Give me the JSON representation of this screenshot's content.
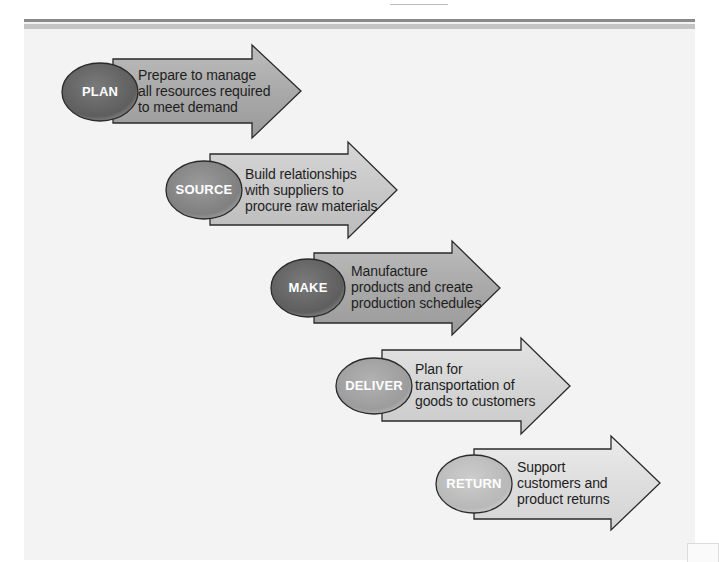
{
  "diagram": {
    "type": "process-flow",
    "steps": [
      {
        "id": "plan",
        "label": "PLAN",
        "description_lines": [
          "Prepare to manage",
          "all resources required",
          "to meet demand"
        ],
        "ellipse_color": "#6e6e6e",
        "arrow_color": "#a8a8a8"
      },
      {
        "id": "source",
        "label": "SOURCE",
        "description_lines": [
          "Build relationships",
          "with suppliers to",
          "procure raw materials"
        ],
        "ellipse_color": "#8a8a8a",
        "arrow_color": "#c4c4c4"
      },
      {
        "id": "make",
        "label": "MAKE",
        "description_lines": [
          "Manufacture",
          "products and create",
          "production schedules"
        ],
        "ellipse_color": "#6e6e6e",
        "arrow_color": "#a8a8a8"
      },
      {
        "id": "deliver",
        "label": "DELIVER",
        "description_lines": [
          "Plan for",
          "transportation of",
          "goods to customers"
        ],
        "ellipse_color": "#a0a0a0",
        "arrow_color": "#d0d0d0"
      },
      {
        "id": "return",
        "label": "RETURN",
        "description_lines": [
          "Support",
          "customers and",
          "product returns"
        ],
        "ellipse_color": "#bdbdbd",
        "arrow_color": "#dcdcdc"
      }
    ]
  }
}
